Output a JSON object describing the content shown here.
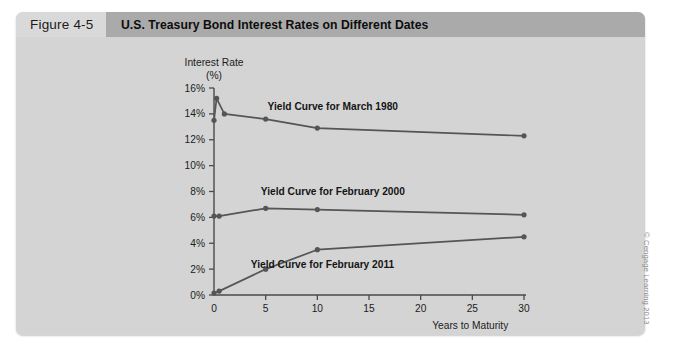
{
  "figure": {
    "label": "Figure 4-5",
    "title": "U.S. Treasury Bond Interest Rates on Different Dates"
  },
  "credit": "© Cengage Learning 2013",
  "colors": {
    "panel_background": "#d4d4d4",
    "header_label_background": "#d9d9d9",
    "header_title_background": "#aaaaaa",
    "curve": "#555555",
    "axis": "#4a4a4a",
    "text": "#1c1c1c"
  },
  "chart_data": {
    "type": "line",
    "title": "U.S. Treasury Bond Interest Rates on Different Dates",
    "xlabel": "Years to Maturity",
    "ylabel": "Interest Rate (%)",
    "ylabel_line1": "Interest Rate",
    "ylabel_line2": "(%)",
    "xlim": [
      0,
      30
    ],
    "ylim": [
      0,
      16
    ],
    "xticks": [
      0,
      5,
      10,
      15,
      20,
      25,
      30
    ],
    "xtick_labels": [
      "0",
      "5",
      "10",
      "15",
      "20",
      "25",
      "30"
    ],
    "yticks": [
      0,
      2,
      4,
      6,
      8,
      10,
      12,
      14,
      16
    ],
    "ytick_labels": [
      "0%",
      "2%",
      "4%",
      "6%",
      "8%",
      "10%",
      "12%",
      "14%",
      "16%"
    ],
    "grid": false,
    "legend": "inline-annotations",
    "series": [
      {
        "name": "Yield Curve for March 1980",
        "label": "Yield Curve for March 1980",
        "label_x": 11.5,
        "label_y": 14.3,
        "x": [
          0,
          0.25,
          1,
          5,
          10,
          30
        ],
        "y": [
          13.5,
          15.2,
          14.0,
          13.6,
          12.9,
          12.3
        ]
      },
      {
        "name": "Yield Curve for February 2000",
        "label": "Yield Curve for February 2000",
        "label_x": 11.5,
        "label_y": 7.7,
        "x": [
          0,
          0.5,
          5,
          10,
          30
        ],
        "y": [
          6.1,
          6.1,
          6.7,
          6.6,
          6.2
        ]
      },
      {
        "name": "Yield Curve for February 2011",
        "label": "Yield Curve for February 2011",
        "label_x": 10.5,
        "label_y": 2.1,
        "x": [
          0,
          0.5,
          5,
          10,
          30
        ],
        "y": [
          0.15,
          0.3,
          2.0,
          3.5,
          4.5
        ]
      }
    ]
  }
}
